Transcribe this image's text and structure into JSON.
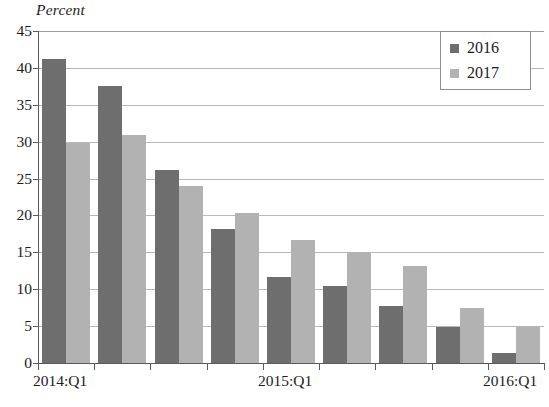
{
  "chart_data": {
    "type": "bar",
    "title": "",
    "ylabel": "Percent",
    "xlabel": "",
    "ylim": [
      0,
      45
    ],
    "yticks": [
      0,
      5,
      10,
      15,
      20,
      25,
      30,
      35,
      40,
      45
    ],
    "ytick_labels": [
      "0",
      "5",
      "10",
      "15",
      "20",
      "25",
      "30",
      "35",
      "40",
      "45"
    ],
    "grid": true,
    "grid_axis": "y",
    "legend_position": "top-right",
    "categories": [
      "2014:Q1",
      "2014:Q2",
      "2014:Q3",
      "2014:Q4",
      "2015:Q1",
      "2015:Q2",
      "2015:Q3",
      "2015:Q4",
      "2016:Q1"
    ],
    "xtick_labels_shown": [
      "2014:Q1",
      "2015:Q1",
      "2016:Q1"
    ],
    "xtick_labels_shown_at": [
      0,
      4,
      8
    ],
    "series": [
      {
        "name": "2016",
        "color": "#6e6e6e",
        "values": [
          41.2,
          37.6,
          26.1,
          18.2,
          11.7,
          10.4,
          7.7,
          4.9,
          1.4
        ]
      },
      {
        "name": "2017",
        "color": "#b2b2b2",
        "values": [
          29.8,
          30.9,
          24.0,
          20.3,
          16.7,
          15.1,
          13.2,
          7.4,
          4.9
        ]
      }
    ]
  },
  "legend": {
    "items": [
      {
        "label": "2016",
        "color": "#6e6e6e"
      },
      {
        "label": "2017",
        "color": "#b2b2b2"
      }
    ]
  },
  "colors": {
    "series_2016": "#6e6e6e",
    "series_2017": "#b2b2b2",
    "gridline": "#b9b9b9",
    "axis": "#5a5a5a",
    "text": "#1c1c1c",
    "background": "#ffffff"
  }
}
